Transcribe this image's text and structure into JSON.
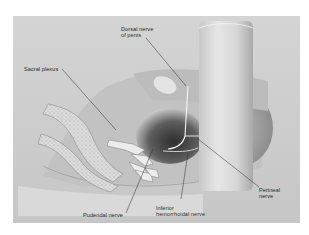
{
  "figure": {
    "type": "anatomical-illustration",
    "background_color": "#cfcfcf",
    "labels": [
      {
        "id": "dorsal",
        "text": "Dorsal nerve\nof penis",
        "x": 108,
        "y": 10
      },
      {
        "id": "sacral",
        "text": "Sacral plexus",
        "x": 11,
        "y": 50
      },
      {
        "id": "perineal",
        "text": "Perineal\nnerve",
        "x": 246,
        "y": 171
      },
      {
        "id": "pudendal",
        "text": "Pudendal nerve",
        "x": 70,
        "y": 196
      },
      {
        "id": "inferior",
        "text": "Inferior\nhemorrhoidal nerve",
        "x": 143,
        "y": 189
      }
    ]
  }
}
